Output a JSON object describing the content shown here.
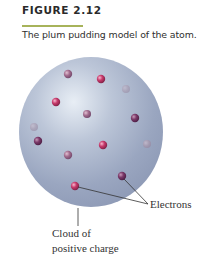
{
  "figure": {
    "number": "FIGURE 2.12",
    "caption": "The plum pudding model of the atom.",
    "accent_color": "#a7b35a"
  },
  "diagram": {
    "cloud": {
      "label_line1": "Cloud of",
      "label_line2": "positive charge",
      "color": "#a9b3c9"
    },
    "electrons": {
      "label": "Electrons",
      "count": 13
    }
  }
}
